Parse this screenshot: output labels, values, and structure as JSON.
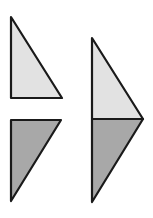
{
  "diagram": {
    "colors": {
      "light_fill": "#e2e2e2",
      "dark_fill": "#a8a8a8",
      "stroke": "#1a1a1a",
      "background": "#ffffff"
    },
    "shapes": [
      {
        "id": "left-top-triangle",
        "fill": "light",
        "points": [
          [
            11,
            17
          ],
          [
            62,
            98
          ],
          [
            11,
            98
          ]
        ]
      },
      {
        "id": "left-bottom-triangle",
        "fill": "dark",
        "points": [
          [
            11,
            120
          ],
          [
            61,
            120
          ],
          [
            11,
            201
          ]
        ]
      },
      {
        "id": "right-top-triangle",
        "fill": "light",
        "points": [
          [
            92,
            38
          ],
          [
            143,
            119
          ],
          [
            92,
            119
          ]
        ]
      },
      {
        "id": "right-bottom-triangle",
        "fill": "dark",
        "points": [
          [
            92,
            119
          ],
          [
            143,
            119
          ],
          [
            92,
            202
          ]
        ]
      }
    ]
  }
}
